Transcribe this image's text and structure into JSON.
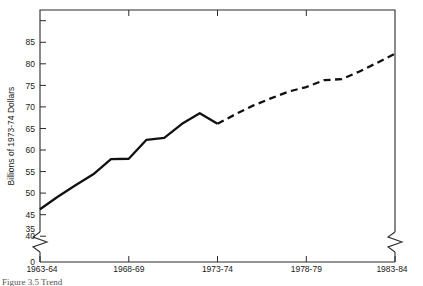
{
  "figure": {
    "caption": "Figure 3.5   Trend",
    "background_color": "#ffffff",
    "line_color": "#111111"
  },
  "chart_data": {
    "type": "line",
    "title": "",
    "xlabel": "",
    "ylabel": "Billions of 1973-74 Dollars",
    "xlim": [
      1963,
      1983
    ],
    "ylim": [
      35,
      90
    ],
    "grid": false,
    "legend": "none",
    "y_axis": {
      "tick_labels": [
        "0",
        "35",
        "40",
        "45",
        "50",
        "55",
        "60",
        "65",
        "70",
        "75",
        "80",
        "85"
      ],
      "unlabeled_ticks": [
        90
      ],
      "axis_break": true,
      "break_between": [
        0,
        35
      ],
      "zero_label": "0"
    },
    "x_axis": {
      "tick_labels": [
        "1963-64",
        "1968-69",
        "1973-74",
        "1978-79",
        "1983-84"
      ],
      "tick_values": [
        1963,
        1968,
        1973,
        1978,
        1983
      ],
      "axis_break_right": true
    },
    "series": [
      {
        "name": "Actual",
        "style": "solid",
        "x": [
          1963,
          1964,
          1965,
          1966,
          1967,
          1968,
          1969,
          1970,
          1971,
          1972,
          1973
        ],
        "values": [
          39.0,
          42.3,
          45.3,
          48.2,
          52.2,
          52.3,
          57.3,
          57.8,
          61.5,
          64.3,
          61.5
        ]
      },
      {
        "name": "Projected",
        "style": "dashed",
        "x": [
          1973,
          1974,
          1975,
          1976,
          1977,
          1978,
          1979,
          1980,
          1981,
          1982,
          1983
        ],
        "values": [
          61.5,
          64.0,
          66.3,
          68.2,
          70.0,
          71.2,
          73.0,
          73.3,
          75.3,
          77.6,
          80.0
        ]
      }
    ]
  },
  "geometry": {
    "plot_left": 40,
    "plot_right": 395,
    "plot_top": 10,
    "plot_bottom": 262,
    "value_top": 91.5,
    "value_bottom": 33.0,
    "zero_y": 262,
    "break_y_top": 232,
    "break_y_bottom": 252,
    "x_left_value": 1963,
    "x_right_value": 1983
  }
}
